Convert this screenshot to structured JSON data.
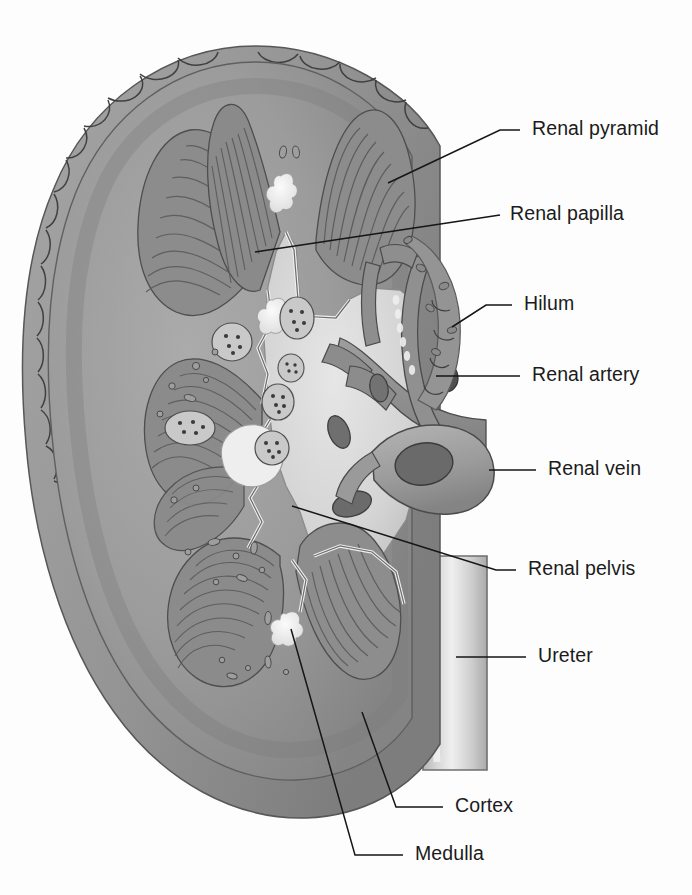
{
  "figure": {
    "background_color": "#fdfdfd",
    "line_color": "#15151a",
    "text_color": "#1b1b1b"
  },
  "palette": {
    "capsule_fat": "#9a9a9a",
    "capsule_fat_dark": "#7e7e7e",
    "cortex": "#9c9c9c",
    "cortex_light": "#ababab",
    "cortex_dark": "#828282",
    "medulla_pyramid": "#8a8a8a",
    "pyramid_stripe": "#5e5e5e",
    "renal_sinus": "#d9d9d9",
    "calyx_pale": "#e6e6e6",
    "papilla_white": "#f2f2f2",
    "artery_gray": "#8f8f8f",
    "vein_gray": "#a2a2a2",
    "vessel_lumen_dark": "#555555",
    "ureter_pale": "#cfcfcf",
    "outline": "#3a3a3a"
  },
  "labels": [
    {
      "id": "renal-pyramid",
      "text": "Renal pyramid",
      "text_x": 532,
      "text_y": 130,
      "leader": "M 520 130 L 500 130 L 388 183"
    },
    {
      "id": "renal-papilla",
      "text": "Renal papilla",
      "text_x": 510,
      "text_y": 215,
      "leader": "M 500 215 L 255 252"
    },
    {
      "id": "hilum",
      "text": "Hilum",
      "text_x": 524,
      "text_y": 305,
      "leader": "M 512 305 L 486 305 L 452 327"
    },
    {
      "id": "renal-artery",
      "text": "Renal artery",
      "text_x": 532,
      "text_y": 376,
      "leader": "M 520 376 L 436 376"
    },
    {
      "id": "renal-vein",
      "text": "Renal vein",
      "text_x": 548,
      "text_y": 470,
      "leader": "M 536 470 L 489 470"
    },
    {
      "id": "renal-pelvis",
      "text": "Renal pelvis",
      "text_x": 528,
      "text_y": 570,
      "leader": "M 516 570 L 496 570 L 292 506"
    },
    {
      "id": "ureter",
      "text": "Ureter",
      "text_x": 538,
      "text_y": 657,
      "leader": "M 526 657 L 456 657"
    },
    {
      "id": "cortex",
      "text": "Cortex",
      "text_x": 455,
      "text_y": 807,
      "leader": "M 443 807 L 396 807 L 362 712"
    },
    {
      "id": "medulla",
      "text": "Medulla",
      "text_x": 415,
      "text_y": 855,
      "leader": "M 403 855 L 355 855 L 291 629"
    }
  ],
  "structures": [
    {
      "id": "renal-capsule",
      "name": "Fibrous capsule / perirenal fat",
      "shape": "scalloped-rim"
    },
    {
      "id": "renal-cortex",
      "name": "Renal cortex",
      "shape": "outer-band"
    },
    {
      "id": "renal-medulla",
      "name": "Renal medulla",
      "shape": "striated-pyramids"
    },
    {
      "id": "renal-pyramids",
      "name": "Renal pyramids",
      "count": 7
    },
    {
      "id": "renal-papillae",
      "name": "Renal papillae",
      "count": 5
    },
    {
      "id": "minor-calyces",
      "name": "Minor calyces",
      "count": 5
    },
    {
      "id": "renal-sinus",
      "name": "Renal sinus / pelvis",
      "shape": "branched-pale-cavity"
    },
    {
      "id": "renal-artery",
      "name": "Renal artery (branching)",
      "shape": "tubular-branched"
    },
    {
      "id": "renal-vein",
      "name": "Renal vein (cut stump)",
      "shape": "tubular-cut"
    },
    {
      "id": "ureter",
      "name": "Ureter",
      "shape": "vertical-tube"
    }
  ]
}
